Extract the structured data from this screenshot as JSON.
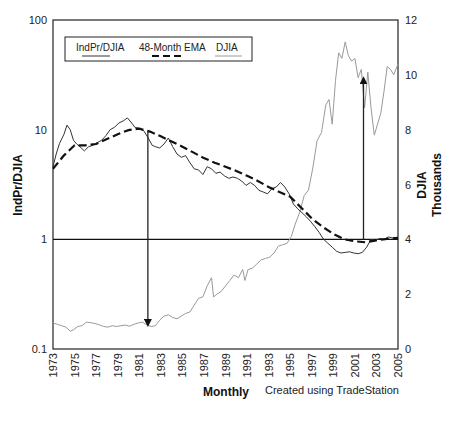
{
  "chart_data": {
    "type": "line",
    "title": "",
    "xlabel": "Monthly",
    "ylabel": "IndPr/DJIA",
    "ylabel_right": [
      "DJIA",
      "Thousands"
    ],
    "x_ticks": [
      "1973",
      "1975",
      "1977",
      "1979",
      "1981",
      "1983",
      "1985",
      "1987",
      "1989",
      "1991",
      "1993",
      "1995",
      "1997",
      "1999",
      "2001",
      "2003",
      "2005"
    ],
    "y_left": {
      "scale": "log",
      "ticks": [
        "100",
        "10",
        "1",
        "0.1"
      ],
      "values": [
        100,
        10,
        1,
        0.1
      ],
      "range": [
        0.1,
        100
      ]
    },
    "y_right": {
      "scale": "linear",
      "ticks": [
        "12",
        "10",
        "8",
        "6",
        "4",
        "2",
        "0"
      ],
      "values": [
        12,
        10,
        8,
        6,
        4,
        2,
        0
      ],
      "range": [
        0,
        12
      ]
    },
    "grid": false,
    "legend": {
      "position": "top-left-inside",
      "entries": [
        "IndPr/DJIA",
        "48-Month EMA",
        "DJIA"
      ]
    },
    "reference_line": {
      "axis": "left",
      "value": 1
    },
    "annotations": [
      {
        "type": "arrow-down",
        "x": 1981.8,
        "from_left": 9.6,
        "to_right_thousands": 0.95
      },
      {
        "type": "arrow-up",
        "x": 2001.8,
        "from_left": 1.0,
        "to_right_thousands": 9.8
      }
    ],
    "series": [
      {
        "name": "IndPr/DJIA",
        "axis": "left",
        "style": "solid-thin",
        "color": "#333333",
        "x": [
          1973,
          1973.3,
          1973.6,
          1974,
          1974.3,
          1974.6,
          1974.9,
          1975.2,
          1975.5,
          1975.9,
          1976.3,
          1976.7,
          1977.1,
          1977.5,
          1977.9,
          1978.3,
          1978.7,
          1979.1,
          1979.5,
          1979.9,
          1980.3,
          1980.6,
          1981,
          1981.4,
          1981.8,
          1982.2,
          1982.5,
          1982.9,
          1983.3,
          1983.7,
          1984.1,
          1984.5,
          1984.9,
          1985.3,
          1985.7,
          1986.1,
          1986.5,
          1986.9,
          1987.3,
          1987.7,
          1988.1,
          1988.5,
          1988.9,
          1989.3,
          1989.7,
          1990.1,
          1990.5,
          1990.9,
          1991.3,
          1991.7,
          1992.1,
          1992.5,
          1992.9,
          1993.3,
          1993.7,
          1994.1,
          1994.5,
          1994.9,
          1995.3,
          1995.7,
          1996.1,
          1996.5,
          1996.9,
          1997.3,
          1997.7,
          1998.1,
          1998.5,
          1998.9,
          1999.3,
          1999.7,
          2000.1,
          2000.5,
          2000.9,
          2001.3,
          2001.7,
          2002.1,
          2002.5,
          2002.9,
          2003.3,
          2003.7,
          2004.1,
          2004.5,
          2004.9,
          2005
        ],
        "values": [
          4.6,
          6.0,
          7.5,
          9.0,
          11.0,
          10.0,
          8.0,
          7.4,
          7.0,
          6.4,
          7.0,
          7.2,
          7.6,
          8.0,
          8.8,
          10.0,
          10.5,
          11.5,
          12.0,
          12.8,
          11.5,
          10.5,
          10.3,
          9.8,
          8.5,
          7.2,
          7.0,
          6.8,
          7.4,
          8.4,
          7.0,
          6.0,
          5.6,
          5.8,
          5.0,
          4.4,
          4.3,
          3.9,
          4.6,
          4.4,
          4.0,
          4.1,
          3.8,
          3.6,
          3.7,
          3.6,
          3.4,
          3.1,
          3.3,
          3.1,
          2.8,
          2.7,
          2.6,
          2.9,
          3.0,
          3.3,
          3.0,
          2.6,
          2.1,
          1.9,
          1.75,
          1.6,
          1.45,
          1.3,
          1.15,
          1.0,
          0.92,
          0.85,
          0.78,
          0.75,
          0.76,
          0.77,
          0.75,
          0.74,
          0.76,
          0.85,
          1.0,
          0.98,
          1.02,
          1.0,
          1.05,
          1.03,
          1.04,
          1.02
        ]
      },
      {
        "name": "48-Month EMA",
        "axis": "left",
        "style": "dashed-thick",
        "color": "#111111",
        "x": [
          1973,
          1974,
          1975,
          1976,
          1977,
          1978,
          1979,
          1980,
          1981,
          1982,
          1983,
          1984,
          1985,
          1986,
          1987,
          1988,
          1989,
          1990,
          1991,
          1992,
          1993,
          1994,
          1995,
          1996,
          1997,
          1998,
          1999,
          2000,
          2001,
          2002,
          2003,
          2004,
          2005
        ],
        "values": [
          4.4,
          5.8,
          7.2,
          7.2,
          7.4,
          8.2,
          9.1,
          9.9,
          10.2,
          9.6,
          8.7,
          7.8,
          7.0,
          6.2,
          5.5,
          5.0,
          4.6,
          4.2,
          3.8,
          3.4,
          3.0,
          2.7,
          2.45,
          1.95,
          1.55,
          1.3,
          1.12,
          1.0,
          0.96,
          0.94,
          0.98,
          1.01,
          1.03
        ]
      },
      {
        "name": "DJIA",
        "axis": "right",
        "unit": "thousands",
        "style": "solid-thin",
        "color": "#9a9a9a",
        "x": [
          1973,
          1973.4,
          1973.8,
          1974.2,
          1974.6,
          1974.9,
          1975.3,
          1975.7,
          1976.1,
          1976.5,
          1976.9,
          1977.3,
          1977.7,
          1978.1,
          1978.5,
          1978.9,
          1979.3,
          1979.7,
          1980.1,
          1980.5,
          1980.9,
          1981.3,
          1981.7,
          1982.1,
          1982.5,
          1982.9,
          1983.3,
          1983.7,
          1984.1,
          1984.5,
          1984.9,
          1985.3,
          1985.7,
          1986.1,
          1986.5,
          1986.9,
          1987.3,
          1987.7,
          1987.9,
          1988.2,
          1988.6,
          1989,
          1989.4,
          1989.8,
          1990.2,
          1990.6,
          1990.8,
          1991.1,
          1991.5,
          1991.9,
          1992.3,
          1992.7,
          1993.1,
          1993.5,
          1993.9,
          1994.3,
          1994.7,
          1995.1,
          1995.5,
          1995.9,
          1996.3,
          1996.7,
          1997.1,
          1997.5,
          1997.9,
          1998.3,
          1998.6,
          1998.9,
          1999.2,
          1999.5,
          1999.8,
          2000.1,
          2000.4,
          2000.7,
          2001,
          2001.3,
          2001.6,
          2001.9,
          2002.2,
          2002.5,
          2002.8,
          2003.1,
          2003.4,
          2003.7,
          2004,
          2004.3,
          2004.6,
          2005
        ],
        "values": [
          0.95,
          0.9,
          0.85,
          0.8,
          0.65,
          0.7,
          0.82,
          0.85,
          0.98,
          0.96,
          0.93,
          0.88,
          0.82,
          0.8,
          0.85,
          0.82,
          0.85,
          0.87,
          0.83,
          0.9,
          0.95,
          0.98,
          0.88,
          0.82,
          0.85,
          1.05,
          1.2,
          1.25,
          1.15,
          1.1,
          1.2,
          1.3,
          1.35,
          1.6,
          1.85,
          1.9,
          2.3,
          2.6,
          1.9,
          2.0,
          2.1,
          2.3,
          2.5,
          2.7,
          2.6,
          2.9,
          2.5,
          2.9,
          2.95,
          3.1,
          3.25,
          3.3,
          3.35,
          3.5,
          3.75,
          3.8,
          3.85,
          4.1,
          4.6,
          5.0,
          5.6,
          5.8,
          6.6,
          7.6,
          7.9,
          8.9,
          9.1,
          8.2,
          9.8,
          10.8,
          10.6,
          11.2,
          10.7,
          10.5,
          10.6,
          9.9,
          10.2,
          8.8,
          10.1,
          8.8,
          7.8,
          8.2,
          8.6,
          9.4,
          10.3,
          10.2,
          10.0,
          10.4
        ]
      }
    ]
  },
  "footer": {
    "text": "Created using TradeStation"
  }
}
